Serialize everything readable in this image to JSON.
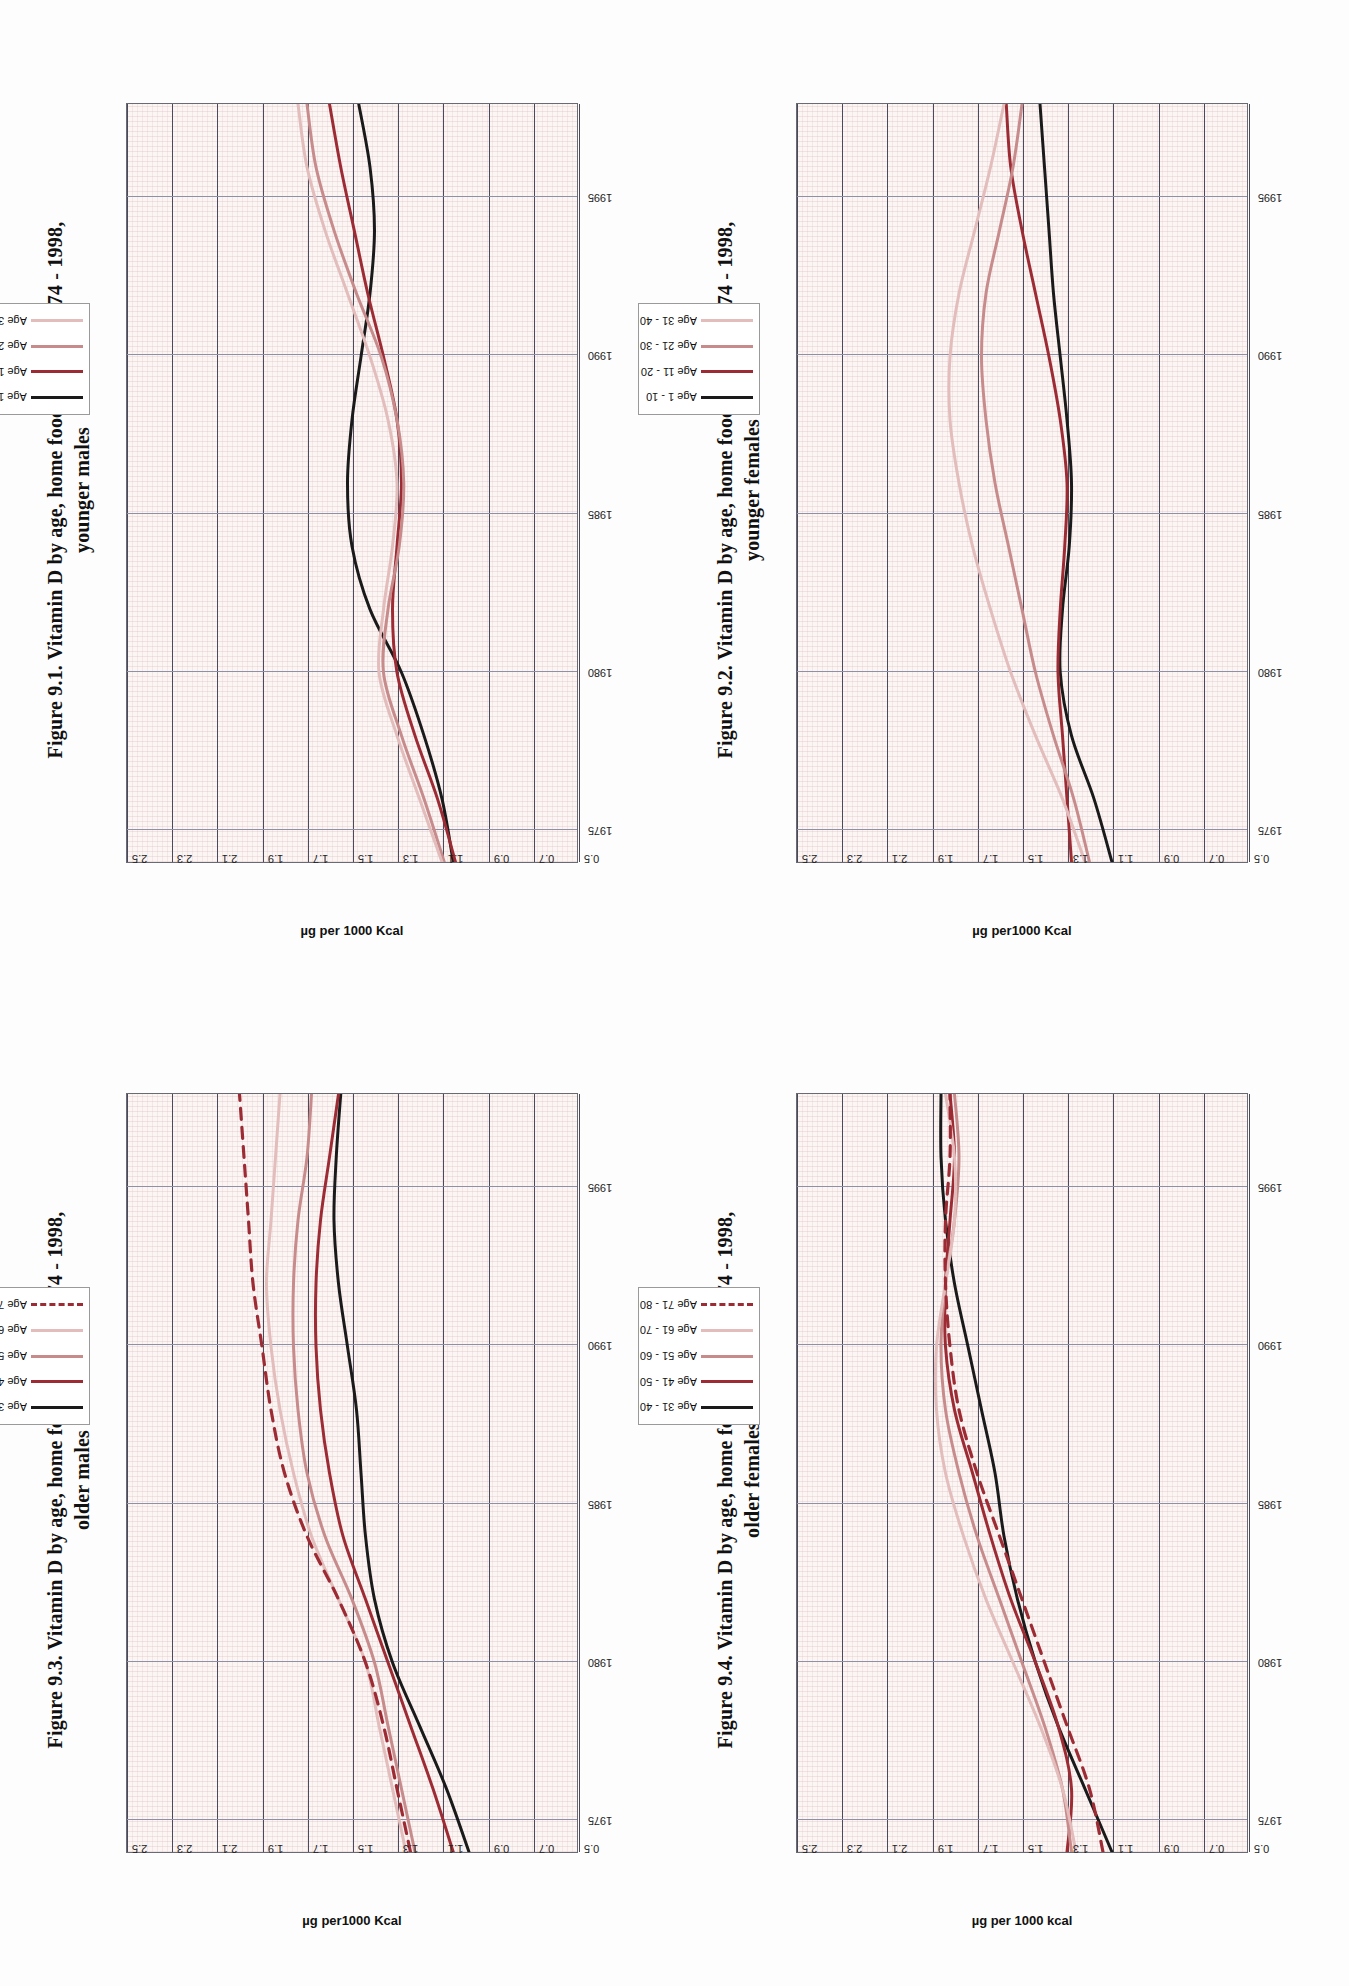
{
  "page": {
    "background": "#ffffff",
    "orientation": "landscape-rotated-90"
  },
  "axis": {
    "ylabel": "µg per 1000 Kcal",
    "yticks": [
      "2.5",
      "2.3",
      "2.1",
      "1.9",
      "1.7",
      "1.5",
      "1.3",
      "1.1",
      "0.9",
      "0.7",
      "0.5"
    ],
    "xticks": [
      "1975",
      "1980",
      "1985",
      "1990",
      "1995"
    ],
    "ylim": [
      0.5,
      2.5
    ],
    "xlim": [
      1974,
      1998
    ]
  },
  "colors": {
    "black": "#1a1a1a",
    "dark_red": "#9d2b34",
    "mid_rose": "#c78b8b",
    "light_rose": "#e3bcbc",
    "dashed_red": "#9d2b34",
    "gridline": "#8f8fa8",
    "frame": "#6a6a74",
    "plot_bg": "#fbf5f4"
  },
  "figures": [
    {
      "id": "fig-91",
      "title": "Figure 9.1. Vitamin D by age, home food supplies 1974 - 1998,",
      "subtitle": "younger males",
      "legend": [
        "Age 1 - 10",
        "Age 11 - 20",
        "Age 21 - 30",
        "Age 31 - 40"
      ]
    },
    {
      "id": "fig-92",
      "title": "Figure 9.2. Vitamin D by age, home food supplies 1974 - 1998,",
      "subtitle": "younger females",
      "legend": [
        "Age 1 - 10",
        "Age 11 - 20",
        "Age 21 - 30",
        "Age 31 - 40"
      ]
    },
    {
      "id": "fig-93",
      "title": "Figure 9.3. Vitamin D  by age, home food supplies 1974 - 1998,",
      "subtitle": "older males",
      "legend": [
        "Age 31 - 40",
        "Age 41 - 50",
        "Age 51 - 60",
        "Age 61 - 70",
        "Age 71 - 80"
      ]
    },
    {
      "id": "fig-94",
      "title": "Figure 9.4. Vitamin D by age, home food supplies 1974 - 1998,",
      "subtitle": "older females",
      "legend": [
        "Age 31 - 40",
        "Age 41 - 50",
        "Age 51 - 60",
        "Age 61 - 70",
        "Age 71 - 80"
      ]
    }
  ],
  "chart_data": [
    {
      "type": "line",
      "title": "Figure 9.1. Vitamin D by age, home food supplies 1974 - 1998, younger males",
      "xlabel": "",
      "ylabel": "µg per 1000 Kcal",
      "ylim": [
        0.5,
        2.5
      ],
      "grid": true,
      "legend_position": "top-right",
      "x": [
        1974,
        1976,
        1978,
        1980,
        1982,
        1984,
        1986,
        1988,
        1990,
        1992,
        1994,
        1996,
        1998
      ],
      "series": [
        {
          "name": "Age 1 - 10",
          "color": "#1a1a1a",
          "values": [
            1.05,
            1.1,
            1.18,
            1.28,
            1.42,
            1.5,
            1.52,
            1.5,
            1.46,
            1.42,
            1.4,
            1.42,
            1.47
          ]
        },
        {
          "name": "Age 11 - 20",
          "color": "#9d2b34",
          "values": [
            1.04,
            1.12,
            1.22,
            1.3,
            1.32,
            1.3,
            1.28,
            1.3,
            1.36,
            1.43,
            1.49,
            1.55,
            1.6
          ]
        },
        {
          "name": "Age 21 - 30",
          "color": "#c78b8b",
          "values": [
            1.09,
            1.18,
            1.28,
            1.36,
            1.34,
            1.29,
            1.27,
            1.3,
            1.37,
            1.48,
            1.58,
            1.66,
            1.7
          ]
        },
        {
          "name": "Age 31 - 40",
          "color": "#e3bcbc",
          "values": [
            1.1,
            1.2,
            1.3,
            1.38,
            1.36,
            1.32,
            1.3,
            1.34,
            1.42,
            1.52,
            1.62,
            1.7,
            1.74
          ]
        }
      ]
    },
    {
      "type": "line",
      "title": "Figure 9.2. Vitamin D by age, home food supplies 1974 - 1998, younger females",
      "xlabel": "",
      "ylabel": "µg per1000 Kcal",
      "ylim": [
        0.5,
        2.5
      ],
      "grid": true,
      "legend_position": "top-right",
      "x": [
        1974,
        1976,
        1978,
        1980,
        1982,
        1984,
        1986,
        1988,
        1990,
        1992,
        1994,
        1996,
        1998
      ],
      "series": [
        {
          "name": "Age 1 - 10",
          "color": "#1a1a1a",
          "values": [
            1.1,
            1.18,
            1.28,
            1.33,
            1.32,
            1.29,
            1.28,
            1.3,
            1.33,
            1.36,
            1.38,
            1.4,
            1.42
          ]
        },
        {
          "name": "Age 11 - 20",
          "color": "#9d2b34",
          "values": [
            1.28,
            1.3,
            1.32,
            1.34,
            1.33,
            1.31,
            1.3,
            1.33,
            1.38,
            1.44,
            1.5,
            1.55,
            1.57
          ]
        },
        {
          "name": "Age 21 - 30",
          "color": "#c78b8b",
          "values": [
            1.2,
            1.27,
            1.36,
            1.44,
            1.5,
            1.56,
            1.62,
            1.66,
            1.68,
            1.66,
            1.6,
            1.54,
            1.5
          ]
        },
        {
          "name": "Age 31 - 40",
          "color": "#e3bcbc",
          "values": [
            1.22,
            1.32,
            1.44,
            1.55,
            1.64,
            1.72,
            1.78,
            1.82,
            1.82,
            1.78,
            1.71,
            1.64,
            1.58
          ]
        }
      ]
    },
    {
      "type": "line",
      "title": "Figure 9.3. Vitamin D  by age, home food supplies 1974 - 1998, older males",
      "xlabel": "",
      "ylabel": "µg per1000 Kcal",
      "ylim": [
        0.5,
        2.5
      ],
      "grid": true,
      "legend_position": "top-right",
      "x": [
        1974,
        1976,
        1978,
        1980,
        1982,
        1984,
        1986,
        1988,
        1990,
        1992,
        1994,
        1996,
        1998
      ],
      "series": [
        {
          "name": "Age 31 - 40",
          "color": "#1a1a1a",
          "values": [
            0.98,
            1.08,
            1.2,
            1.32,
            1.4,
            1.44,
            1.46,
            1.48,
            1.52,
            1.56,
            1.58,
            1.57,
            1.55
          ]
        },
        {
          "name": "Age 41 - 50",
          "color": "#9d2b34",
          "values": [
            1.05,
            1.14,
            1.24,
            1.34,
            1.44,
            1.54,
            1.6,
            1.64,
            1.66,
            1.66,
            1.64,
            1.6,
            1.56
          ]
        },
        {
          "name": "Age 51 - 60",
          "color": "#c78b8b",
          "values": [
            1.22,
            1.28,
            1.34,
            1.4,
            1.5,
            1.62,
            1.7,
            1.74,
            1.76,
            1.76,
            1.74,
            1.7,
            1.68
          ]
        },
        {
          "name": "Age 61 - 70",
          "color": "#e3bcbc",
          "values": [
            1.26,
            1.32,
            1.38,
            1.44,
            1.56,
            1.68,
            1.76,
            1.82,
            1.86,
            1.88,
            1.86,
            1.84,
            1.82
          ]
        },
        {
          "name": "Age 71 - 80",
          "color": "#9d2b34",
          "style": "dashed",
          "values": [
            1.24,
            1.3,
            1.36,
            1.44,
            1.56,
            1.7,
            1.8,
            1.86,
            1.9,
            1.94,
            1.96,
            1.98,
            2.0
          ]
        }
      ]
    },
    {
      "type": "line",
      "title": "Figure 9.4. Vitamin D by age, home food supplies 1974 - 1998, older females",
      "xlabel": "",
      "ylabel": "µg per 1000 kcal",
      "ylim": [
        0.5,
        2.5
      ],
      "grid": true,
      "legend_position": "top-right",
      "x": [
        1974,
        1976,
        1978,
        1980,
        1982,
        1984,
        1986,
        1988,
        1990,
        1992,
        1994,
        1996,
        1998
      ],
      "series": [
        {
          "name": "Age 31 - 40",
          "color": "#1a1a1a",
          "values": [
            1.1,
            1.22,
            1.34,
            1.44,
            1.52,
            1.58,
            1.62,
            1.68,
            1.74,
            1.8,
            1.84,
            1.86,
            1.86
          ]
        },
        {
          "name": "Age 41 - 50",
          "color": "#9d2b34",
          "values": [
            1.3,
            1.28,
            1.34,
            1.44,
            1.55,
            1.64,
            1.72,
            1.8,
            1.84,
            1.84,
            1.82,
            1.8,
            1.82
          ]
        },
        {
          "name": "Age 51 - 60",
          "color": "#c78b8b",
          "values": [
            1.28,
            1.32,
            1.4,
            1.5,
            1.6,
            1.7,
            1.78,
            1.84,
            1.86,
            1.84,
            1.8,
            1.78,
            1.8
          ]
        },
        {
          "name": "Age 61 - 70",
          "color": "#e3bcbc",
          "values": [
            1.26,
            1.32,
            1.42,
            1.54,
            1.66,
            1.76,
            1.84,
            1.88,
            1.88,
            1.84,
            1.8,
            1.8,
            1.84
          ]
        },
        {
          "name": "Age 71 - 80",
          "color": "#9d2b34",
          "style": "dashed",
          "values": [
            1.14,
            1.2,
            1.3,
            1.4,
            1.5,
            1.6,
            1.7,
            1.78,
            1.82,
            1.84,
            1.84,
            1.82,
            1.82
          ]
        }
      ]
    }
  ]
}
